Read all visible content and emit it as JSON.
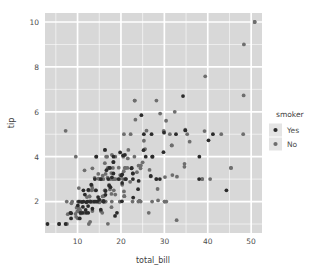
{
  "figure": {
    "background_color": "#ffffff",
    "panel_color": "#d8d8d8",
    "gridline_color": "#ffffff",
    "text_color": "#4d4d4d"
  },
  "axes": {
    "x_title": "total_bill",
    "y_title": "tip",
    "x_ticks": [
      "10",
      "20",
      "30",
      "40",
      "50"
    ],
    "y_ticks": [
      "2",
      "4",
      "6",
      "8",
      "10"
    ]
  },
  "legend": {
    "title": "smoker",
    "items": [
      {
        "label": "Yes",
        "color": "#2b2b2b"
      },
      {
        "label": "No",
        "color": "#6e6e6e"
      }
    ]
  },
  "chart_data": {
    "type": "scatter",
    "title": "",
    "xlabel": "total_bill",
    "ylabel": "tip",
    "xlim": [
      2.5,
      52.5
    ],
    "ylim": [
      0.6,
      10.4
    ],
    "x_ticks": [
      10,
      20,
      30,
      40,
      50
    ],
    "y_ticks": [
      2,
      4,
      6,
      8,
      10
    ],
    "grid": true,
    "legend_position": "right",
    "legend_title": "smoker",
    "series": [
      {
        "name": "Yes",
        "color": "#2b2b2b",
        "points": [
          [
            38.01,
            3.0
          ],
          [
            11.24,
            1.76
          ],
          [
            20.29,
            3.21
          ],
          [
            13.81,
            2.0
          ],
          [
            11.02,
            1.98
          ],
          [
            18.29,
            3.76
          ],
          [
            17.59,
            2.64
          ],
          [
            20.08,
            3.15
          ],
          [
            16.45,
            2.47
          ],
          [
            3.07,
            1.0
          ],
          [
            20.23,
            2.01
          ],
          [
            15.01,
            2.09
          ],
          [
            12.02,
            1.97
          ],
          [
            17.07,
            3.0
          ],
          [
            26.86,
            3.14
          ],
          [
            25.28,
            5.0
          ],
          [
            14.73,
            2.2
          ],
          [
            10.51,
            1.25
          ],
          [
            17.92,
            3.08
          ],
          [
            27.2,
            4.0
          ],
          [
            22.76,
            3.0
          ],
          [
            17.29,
            2.71
          ],
          [
            19.44,
            3.0
          ],
          [
            16.66,
            3.4
          ],
          [
            10.07,
            1.83
          ],
          [
            32.68,
            5.0
          ],
          [
            15.98,
            2.03
          ],
          [
            34.83,
            5.17
          ],
          [
            13.03,
            2.0
          ],
          [
            18.28,
            4.0
          ],
          [
            24.71,
            5.85
          ],
          [
            21.16,
            3.0
          ],
          [
            28.97,
            3.0
          ],
          [
            22.49,
            3.5
          ],
          [
            5.75,
            1.0
          ],
          [
            16.32,
            4.3
          ],
          [
            22.75,
            3.25
          ],
          [
            40.17,
            4.73
          ],
          [
            27.28,
            4.0
          ],
          [
            12.03,
            1.5
          ],
          [
            21.01,
            3.0
          ],
          [
            12.46,
            1.5
          ],
          [
            11.35,
            2.5
          ],
          [
            15.38,
            3.0
          ],
          [
            44.3,
            2.5
          ],
          [
            22.42,
            3.48
          ],
          [
            20.92,
            4.08
          ],
          [
            15.36,
            1.64
          ],
          [
            20.49,
            4.06
          ],
          [
            25.21,
            4.29
          ],
          [
            18.24,
            3.76
          ],
          [
            14.31,
            4.0
          ],
          [
            14.0,
            3.0
          ],
          [
            7.25,
            1.0
          ],
          [
            38.07,
            4.0
          ],
          [
            23.95,
            2.55
          ],
          [
            25.71,
            4.0
          ],
          [
            17.31,
            3.5
          ],
          [
            29.93,
            5.07
          ],
          [
            10.65,
            1.5
          ],
          [
            12.43,
            1.8
          ],
          [
            24.08,
            2.92
          ],
          [
            11.69,
            2.31
          ],
          [
            13.42,
            1.68
          ],
          [
            14.26,
            2.5
          ],
          [
            15.95,
            2.0
          ],
          [
            12.48,
            2.52
          ],
          [
            29.8,
            4.2
          ],
          [
            8.52,
            1.48
          ],
          [
            14.52,
            2.0
          ],
          [
            11.38,
            2.0
          ],
          [
            22.82,
            2.18
          ],
          [
            19.08,
            1.5
          ],
          [
            20.27,
            2.83
          ],
          [
            11.17,
            1.5
          ],
          [
            12.26,
            2.0
          ],
          [
            18.26,
            3.25
          ],
          [
            8.51,
            1.25
          ],
          [
            10.33,
            2.0
          ],
          [
            14.15,
            2.0
          ],
          [
            16.0,
            2.0
          ],
          [
            13.16,
            2.75
          ],
          [
            17.47,
            3.5
          ],
          [
            34.3,
            6.7
          ],
          [
            41.19,
            5.0
          ],
          [
            27.05,
            5.0
          ],
          [
            16.43,
            2.3
          ],
          [
            8.35,
            1.5
          ],
          [
            18.64,
            1.36
          ],
          [
            11.87,
            1.63
          ],
          [
            19.81,
            4.19
          ],
          [
            28.15,
            3.0
          ]
        ]
      },
      {
        "name": "No",
        "color": "#6e6e6e",
        "points": [
          [
            16.99,
            1.01
          ],
          [
            10.34,
            1.66
          ],
          [
            21.01,
            3.5
          ],
          [
            23.68,
            3.31
          ],
          [
            24.59,
            3.61
          ],
          [
            25.29,
            4.71
          ],
          [
            8.77,
            2.0
          ],
          [
            26.88,
            3.12
          ],
          [
            15.04,
            1.96
          ],
          [
            14.78,
            3.23
          ],
          [
            10.27,
            1.71
          ],
          [
            35.26,
            5.0
          ],
          [
            15.42,
            1.57
          ],
          [
            18.43,
            3.0
          ],
          [
            14.83,
            3.02
          ],
          [
            21.58,
            3.92
          ],
          [
            10.33,
            1.67
          ],
          [
            16.29,
            3.71
          ],
          [
            16.97,
            3.5
          ],
          [
            20.65,
            3.35
          ],
          [
            17.92,
            4.08
          ],
          [
            20.29,
            2.75
          ],
          [
            15.77,
            2.23
          ],
          [
            39.42,
            7.58
          ],
          [
            19.82,
            3.18
          ],
          [
            17.81,
            2.34
          ],
          [
            13.37,
            2.0
          ],
          [
            12.69,
            2.0
          ],
          [
            21.7,
            4.3
          ],
          [
            19.65,
            3.0
          ],
          [
            9.55,
            1.45
          ],
          [
            18.35,
            2.5
          ],
          [
            15.06,
            3.0
          ],
          [
            20.69,
            2.45
          ],
          [
            17.78,
            3.27
          ],
          [
            24.06,
            3.6
          ],
          [
            16.31,
            2.0
          ],
          [
            16.93,
            3.07
          ],
          [
            18.69,
            2.31
          ],
          [
            31.27,
            5.0
          ],
          [
            16.04,
            2.24
          ],
          [
            17.46,
            2.54
          ],
          [
            13.94,
            3.06
          ],
          [
            9.68,
            1.32
          ],
          [
            30.4,
            5.6
          ],
          [
            18.29,
            3.0
          ],
          [
            22.23,
            5.0
          ],
          [
            32.4,
            6.0
          ],
          [
            28.55,
            2.05
          ],
          [
            18.04,
            3.0
          ],
          [
            12.54,
            2.5
          ],
          [
            10.29,
            2.6
          ],
          [
            34.81,
            5.2
          ],
          [
            9.94,
            1.56
          ],
          [
            25.56,
            4.34
          ],
          [
            19.49,
            3.51
          ],
          [
            38.73,
            3.0
          ],
          [
            24.27,
            2.03
          ],
          [
            12.76,
            2.23
          ],
          [
            30.06,
            2.0
          ],
          [
            25.89,
            5.16
          ],
          [
            48.33,
            9.0
          ],
          [
            13.27,
            2.5
          ],
          [
            28.17,
            6.5
          ],
          [
            12.9,
            1.1
          ],
          [
            28.15,
            3.0
          ],
          [
            11.59,
            1.5
          ],
          [
            7.74,
            1.44
          ],
          [
            30.14,
            3.09
          ],
          [
            12.16,
            2.2
          ],
          [
            13.42,
            3.48
          ],
          [
            8.58,
            1.92
          ],
          [
            15.98,
            3.0
          ],
          [
            13.42,
            1.58
          ],
          [
            16.27,
            2.5
          ],
          [
            10.09,
            2.0
          ],
          [
            20.45,
            3.0
          ],
          [
            13.28,
            2.72
          ],
          [
            22.12,
            2.88
          ],
          [
            24.01,
            2.0
          ],
          [
            15.69,
            3.0
          ],
          [
            11.61,
            3.39
          ],
          [
            10.77,
            1.47
          ],
          [
            15.53,
            3.0
          ],
          [
            10.07,
            1.25
          ],
          [
            12.6,
            1.0
          ],
          [
            32.83,
            1.17
          ],
          [
            35.83,
            4.67
          ],
          [
            29.03,
            5.92
          ],
          [
            27.18,
            2.0
          ],
          [
            22.67,
            2.0
          ],
          [
            17.82,
            1.75
          ],
          [
            18.78,
            3.0
          ],
          [
            50.81,
            10.0
          ],
          [
            45.35,
            3.5
          ],
          [
            23.17,
            6.5
          ],
          [
            40.55,
            3.0
          ],
          [
            20.69,
            5.0
          ],
          [
            20.9,
            3.5
          ],
          [
            30.46,
            2.0
          ],
          [
            18.15,
            3.5
          ],
          [
            23.1,
            4.0
          ],
          [
            15.69,
            1.5
          ],
          [
            19.77,
            2.0
          ],
          [
            39.26,
            5.14
          ],
          [
            26.41,
            1.5
          ],
          [
            48.27,
            6.73
          ],
          [
            20.76,
            2.24
          ],
          [
            31.71,
            4.5
          ],
          [
            10.59,
            1.61
          ],
          [
            10.63,
            2.0
          ],
          [
            50.81,
            10.0
          ],
          [
            15.81,
            3.16
          ],
          [
            7.25,
            5.15
          ],
          [
            31.85,
            3.18
          ],
          [
            16.82,
            4.0
          ],
          [
            32.9,
            3.11
          ],
          [
            17.89,
            2.0
          ],
          [
            14.48,
            2.0
          ],
          [
            9.6,
            4.0
          ],
          [
            34.63,
            3.55
          ],
          [
            34.65,
            3.68
          ],
          [
            23.33,
            5.65
          ],
          [
            45.35,
            3.5
          ],
          [
            23.17,
            6.5
          ],
          [
            9.78,
            1.73
          ],
          [
            7.51,
            2.0
          ],
          [
            14.07,
            2.5
          ],
          [
            13.13,
            2.0
          ],
          [
            17.26,
            2.74
          ],
          [
            24.55,
            2.0
          ],
          [
            19.77,
            2.0
          ],
          [
            29.85,
            5.14
          ],
          [
            48.17,
            5.0
          ],
          [
            25.0,
            3.75
          ],
          [
            13.39,
            2.61
          ],
          [
            16.49,
            2.0
          ],
          [
            21.5,
            3.5
          ],
          [
            12.66,
            2.5
          ],
          [
            16.21,
            2.0
          ],
          [
            13.81,
            2.0
          ],
          [
            17.51,
            3.0
          ],
          [
            24.52,
            3.48
          ],
          [
            20.76,
            2.24
          ],
          [
            31.71,
            4.5
          ],
          [
            28.44,
            2.56
          ],
          [
            15.48,
            2.02
          ],
          [
            16.58,
            4.0
          ],
          [
            7.56,
            1.0
          ],
          [
            10.34,
            2.0
          ],
          [
            43.11,
            5.0
          ],
          [
            13.0,
            2.0
          ],
          [
            13.51,
            2.0
          ],
          [
            18.71,
            4.0
          ],
          [
            12.74,
            2.01
          ],
          [
            13.0,
            2.0
          ],
          [
            16.4,
            2.5
          ],
          [
            20.53,
            4.0
          ],
          [
            16.47,
            3.23
          ],
          [
            26.59,
            3.41
          ],
          [
            38.73,
            3.0
          ],
          [
            24.27,
            2.03
          ],
          [
            12.76,
            2.23
          ],
          [
            30.06,
            2.0
          ],
          [
            29.85,
            5.14
          ],
          [
            14.31,
            4.0
          ],
          [
            5.75,
            1.0
          ],
          [
            16.32,
            4.3
          ],
          [
            22.75,
            3.25
          ]
        ]
      }
    ]
  }
}
